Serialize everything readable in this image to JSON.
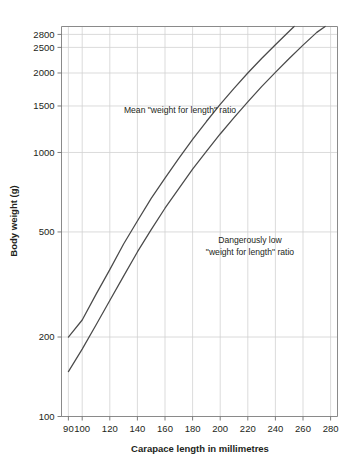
{
  "chart_data": {
    "type": "line",
    "title": "",
    "xlabel": "Carapace length in millimetres",
    "ylabel": "Body weight (g)",
    "yscale": "log",
    "xscale": "linear",
    "xlim": [
      85,
      285
    ],
    "ylim": [
      100,
      3000
    ],
    "grid": true,
    "legend_position": "inline-annotation",
    "xticks": [
      90,
      100,
      120,
      140,
      160,
      180,
      200,
      220,
      240,
      260,
      280
    ],
    "xtick_labels": [
      "90",
      "100",
      "120",
      "140",
      "160",
      "180",
      "200",
      "220",
      "240",
      "260",
      "280"
    ],
    "yticks": [
      100,
      200,
      500,
      1000,
      1500,
      2000,
      2500,
      2800
    ],
    "ytick_labels": [
      "100",
      "200",
      "500",
      "1000",
      "1500",
      "2000",
      "2500",
      "2800"
    ],
    "x": [
      90,
      100,
      110,
      120,
      130,
      140,
      150,
      160,
      170,
      180,
      190,
      200,
      210,
      220,
      230,
      240,
      250,
      260,
      270,
      278,
      280
    ],
    "series": [
      {
        "name": "Mean \"weight for length\" ratio",
        "label": "Mean \"weight for length\" ratio",
        "values": [
          200,
          232,
          290,
          360,
          450,
          550,
          670,
          800,
          950,
          1120,
          1310,
          1520,
          1750,
          2000,
          2270,
          2560,
          2880,
          3230,
          3600,
          2880,
          3950
        ],
        "x_end": 278,
        "y_end": 2880
      },
      {
        "name": "Dangerously low \"weight for length\" ratio",
        "label": "Dangerously low \"weight for length\" ratio",
        "values": [
          148,
          180,
          222,
          275,
          340,
          420,
          510,
          615,
          730,
          865,
          1010,
          1175,
          1355,
          1555,
          1775,
          2010,
          2270,
          2550,
          2850,
          3050,
          3120
        ],
        "x_end": 280,
        "y_end": 2350
      }
    ],
    "annotations": [
      {
        "id": "mean-ratio",
        "text": "Mean \"weight for length\" ratio",
        "lines": [
          "Mean \"weight for length\" ratio"
        ],
        "x_px": 180,
        "y_px": 110
      },
      {
        "id": "dangerously-low-ratio",
        "text": "Dangerously low \"weight for length\" ratio",
        "lines": [
          "Dangerously low",
          "\"weight for length\" ratio"
        ],
        "x_px": 250,
        "y_px": 243
      }
    ]
  },
  "colors": {
    "background": "#ffffff",
    "curve": "#4a4a4a",
    "grid": "#d2d2d2",
    "axis": "#8a8a8a",
    "text": "#231f20"
  }
}
